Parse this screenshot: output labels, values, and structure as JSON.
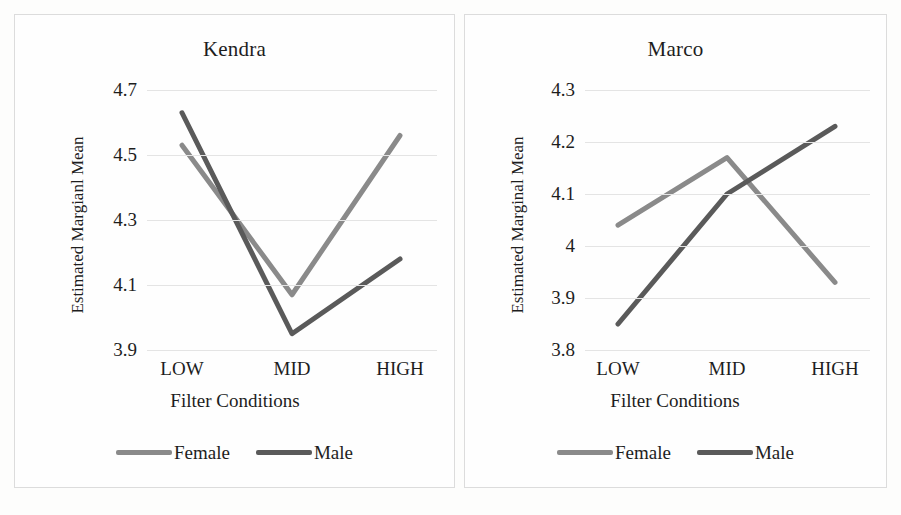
{
  "figure": {
    "background_color": "#fdfdfc",
    "panel_border_color": "#dcdcdc",
    "gridline_color": "#e4e4e4"
  },
  "series_colors": {
    "female": "#8a8a8a",
    "male": "#5a5a5a"
  },
  "panels": [
    {
      "id": "kendra",
      "title": "Kendra",
      "ylabel": "Estimated Margianl Mean",
      "xlabel": "Filter Conditions",
      "legend": [
        {
          "name": "Female",
          "color": "#8a8a8a"
        },
        {
          "name": "Male",
          "color": "#5a5a5a"
        }
      ],
      "chart_data": {
        "type": "line",
        "title": "Kendra",
        "xlabel": "Filter Conditions",
        "ylabel": "Estimated Margianl Mean",
        "categories": [
          "LOW",
          "MID",
          "HIGH"
        ],
        "series": [
          {
            "name": "Female",
            "values": [
              4.53,
              4.07,
              4.56
            ],
            "color": "#8a8a8a"
          },
          {
            "name": "Male",
            "values": [
              4.63,
              3.95,
              4.18
            ],
            "color": "#5a5a5a"
          }
        ],
        "yticks": [
          "3.9",
          "4.1",
          "4.3",
          "4.5",
          "4.7"
        ],
        "ytick_values": [
          3.9,
          4.1,
          4.3,
          4.5,
          4.7
        ],
        "ylim": [
          3.9,
          4.7
        ],
        "grid": true,
        "legend_position": "bottom"
      }
    },
    {
      "id": "marco",
      "title": "Marco",
      "ylabel": "Estimated Marginal Mean",
      "xlabel": "Filter Conditions",
      "legend": [
        {
          "name": "Female",
          "color": "#8a8a8a"
        },
        {
          "name": "Male",
          "color": "#5a5a5a"
        }
      ],
      "chart_data": {
        "type": "line",
        "title": "Marco",
        "xlabel": "Filter Conditions",
        "ylabel": "Estimated Marginal Mean",
        "categories": [
          "LOW",
          "MID",
          "HIGH"
        ],
        "series": [
          {
            "name": "Female",
            "values": [
              4.04,
              4.17,
              3.93
            ],
            "color": "#8a8a8a"
          },
          {
            "name": "Male",
            "values": [
              3.85,
              4.1,
              4.23
            ],
            "color": "#5a5a5a"
          }
        ],
        "yticks": [
          "3.8",
          "3.9",
          "4",
          "4.1",
          "4.2",
          "4.3"
        ],
        "ytick_values": [
          3.8,
          3.9,
          4.0,
          4.1,
          4.2,
          4.3
        ],
        "ylim": [
          3.8,
          4.3
        ],
        "grid": true,
        "legend_position": "bottom"
      }
    }
  ]
}
